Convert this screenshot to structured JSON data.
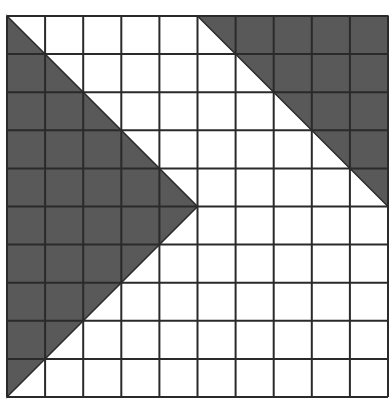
{
  "diagram": {
    "title": "",
    "grid": {
      "rows": 10,
      "cols": 10,
      "origin_x": 7,
      "origin_y": 16,
      "cell": 38.1,
      "line_color": "#2a2a2a",
      "background": "#ffffff"
    },
    "shapes": [
      {
        "name": "left-triangle",
        "fill": "#595959",
        "points": [
          [
            0,
            0
          ],
          [
            5,
            5
          ],
          [
            0,
            10
          ]
        ]
      },
      {
        "name": "top-right-triangle",
        "fill": "#595959",
        "points": [
          [
            5,
            0
          ],
          [
            10,
            0
          ],
          [
            10,
            5
          ]
        ]
      }
    ]
  }
}
